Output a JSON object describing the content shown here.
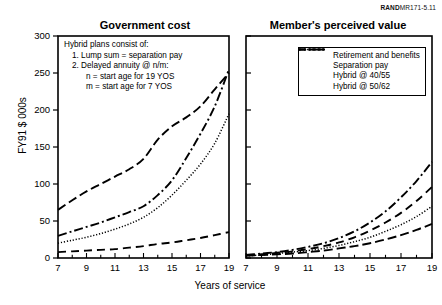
{
  "source_note": {
    "bold": "RAND",
    "rest": "MR171-5.11"
  },
  "axis": {
    "ylabel": "FY91 $ 000s",
    "xlabel": "Years of service",
    "yticks": [
      0,
      50,
      100,
      150,
      200,
      250,
      300
    ],
    "xticks_labeled": [
      7,
      9,
      11,
      13,
      15,
      17,
      19
    ],
    "xticks_all": [
      7,
      8,
      9,
      10,
      11,
      12,
      13,
      14,
      15,
      16,
      17,
      18,
      19
    ]
  },
  "annotation": {
    "title": "Hybrid plans consist of:",
    "item1": "1.  Lump sum = separation pay",
    "item2": "2.  Delayed annuity @ n/m:",
    "item2a": "n = start age for 19 YOS",
    "item2b": "m = start age for 7 YOS"
  },
  "legend": {
    "items": [
      {
        "label": "Retirement and benefits",
        "style": "dotted"
      },
      {
        "label": "Separation pay",
        "style": "dashed"
      },
      {
        "label": "Hybrid @ 40/55",
        "style": "dashdot"
      },
      {
        "label": "Hybrid @ 50/62",
        "style": "fine-dotted"
      }
    ]
  },
  "chart_data": {
    "type": "line",
    "xlabel": "Years of service",
    "ylabel": "FY91 $ 000s",
    "xlim": [
      7,
      19
    ],
    "ylim": [
      0,
      300
    ],
    "grid": false,
    "legend_position": "top-right of right panel",
    "panels": [
      {
        "title": "Government cost",
        "x": [
          7,
          8,
          9,
          10,
          11,
          12,
          13,
          14,
          15,
          16,
          17,
          18,
          19
        ],
        "series": [
          {
            "name": "Retirement and benefits",
            "style": "dashed-long",
            "values": [
              65,
              78,
              90,
              100,
              110,
              120,
              134,
              160,
              178,
              190,
              205,
              228,
              250
            ]
          },
          {
            "name": "Separation pay",
            "style": "dashed",
            "values": [
              8,
              9,
              10,
              11,
              12,
              14,
              16,
              19,
              21,
              24,
              27,
              31,
              35
            ]
          },
          {
            "name": "Hybrid @ 40/55",
            "style": "dashdot",
            "values": [
              30,
              36,
              42,
              48,
              55,
              62,
              70,
              85,
              105,
              135,
              168,
              205,
              255
            ]
          },
          {
            "name": "Hybrid @ 50/62",
            "style": "dotted",
            "values": [
              20,
              24,
              28,
              33,
              39,
              46,
              55,
              68,
              85,
              105,
              127,
              155,
              195
            ]
          }
        ]
      },
      {
        "title": "Member's perceived value",
        "x": [
          7,
          8,
          9,
          10,
          11,
          12,
          13,
          14,
          15,
          16,
          17,
          18,
          19
        ],
        "series": [
          {
            "name": "Retirement and benefits",
            "style": "dashed-long",
            "values": [
              3,
              4,
              5,
              6,
              8,
              10,
              13,
              16,
              20,
              25,
              31,
              38,
              46
            ]
          },
          {
            "name": "Separation pay",
            "style": "dashed",
            "values": [
              4,
              5,
              7,
              9,
              12,
              16,
              21,
              28,
              37,
              48,
              61,
              77,
              96
            ]
          },
          {
            "name": "Hybrid @ 40/55",
            "style": "dashdot",
            "values": [
              4,
              6,
              8,
              11,
              15,
              20,
              27,
              36,
              48,
              63,
              82,
              104,
              130
            ]
          },
          {
            "name": "Hybrid @ 50/62",
            "style": "dotted",
            "values": [
              3,
              4,
              6,
              8,
              10,
              13,
              17,
              22,
              28,
              36,
              45,
              56,
              70
            ]
          }
        ]
      }
    ]
  }
}
